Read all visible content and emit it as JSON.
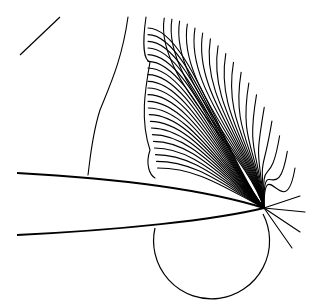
{
  "figure": {
    "type": "contour-plot",
    "background": "#ffffff",
    "line_color": "#000000",
    "focal_point": [
      264,
      208
    ],
    "body": {
      "upper_surface": "M17,173 C110,178 200,188 264,208",
      "lower_surface": "M17,235 C120,230 215,220 264,208"
    },
    "lower_circle": {
      "cx": 213,
      "cy": 258,
      "r": 56
    },
    "fan_count": 40,
    "upper_left_segment": "M20,55 L60,17"
  }
}
